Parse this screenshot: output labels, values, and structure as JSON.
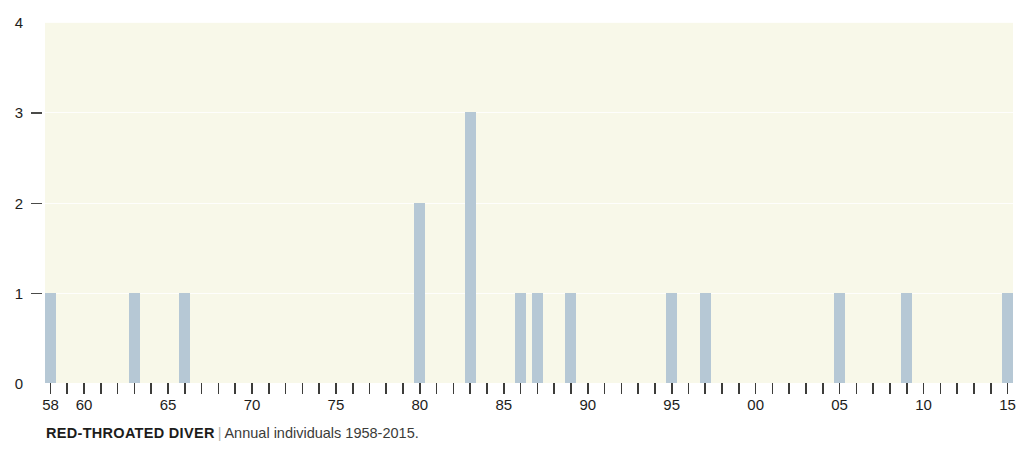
{
  "caption": {
    "species": "RED-THROATED DIVER",
    "separator": "|",
    "subtitle": "Annual individuals 1958-2015."
  },
  "chart_data": {
    "type": "bar",
    "title": "RED-THROATED DIVER",
    "subtitle": "Annual individuals 1958-2015.",
    "xlabel": "",
    "ylabel": "",
    "ylim": [
      0,
      4
    ],
    "xlim": [
      1958,
      2015
    ],
    "grid": true,
    "legend": null,
    "bar_color": "#b6c8d5",
    "plot_background": "#f8f8e9",
    "y_ticks": [
      0,
      1,
      2,
      3,
      4
    ],
    "y_tick_labels": [
      "0",
      "1",
      "2",
      "3",
      "4"
    ],
    "x_tick_years": [
      1958,
      1959,
      1960,
      1961,
      1962,
      1963,
      1964,
      1965,
      1966,
      1967,
      1968,
      1969,
      1970,
      1971,
      1972,
      1973,
      1974,
      1975,
      1976,
      1977,
      1978,
      1979,
      1980,
      1981,
      1982,
      1983,
      1984,
      1985,
      1986,
      1987,
      1988,
      1989,
      1990,
      1991,
      1992,
      1993,
      1994,
      1995,
      1996,
      1997,
      1998,
      1999,
      2000,
      2001,
      2002,
      2003,
      2004,
      2005,
      2006,
      2007,
      2008,
      2009,
      2010,
      2011,
      2012,
      2013,
      2014,
      2015
    ],
    "x_labeled_ticks": [
      {
        "year": 1958,
        "label": "58"
      },
      {
        "year": 1960,
        "label": "60"
      },
      {
        "year": 1965,
        "label": "65"
      },
      {
        "year": 1970,
        "label": "70"
      },
      {
        "year": 1975,
        "label": "75"
      },
      {
        "year": 1980,
        "label": "80"
      },
      {
        "year": 1985,
        "label": "85"
      },
      {
        "year": 1990,
        "label": "90"
      },
      {
        "year": 1995,
        "label": "95"
      },
      {
        "year": 2000,
        "label": "00"
      },
      {
        "year": 2005,
        "label": "05"
      },
      {
        "year": 2010,
        "label": "10"
      },
      {
        "year": 2015,
        "label": "15"
      }
    ],
    "categories": [
      1958,
      1959,
      1960,
      1961,
      1962,
      1963,
      1964,
      1965,
      1966,
      1967,
      1968,
      1969,
      1970,
      1971,
      1972,
      1973,
      1974,
      1975,
      1976,
      1977,
      1978,
      1979,
      1980,
      1981,
      1982,
      1983,
      1984,
      1985,
      1986,
      1987,
      1988,
      1989,
      1990,
      1991,
      1992,
      1993,
      1994,
      1995,
      1996,
      1997,
      1998,
      1999,
      2000,
      2001,
      2002,
      2003,
      2004,
      2005,
      2006,
      2007,
      2008,
      2009,
      2010,
      2011,
      2012,
      2013,
      2014,
      2015
    ],
    "values": [
      1,
      0,
      0,
      0,
      0,
      1,
      0,
      0,
      1,
      0,
      0,
      0,
      0,
      0,
      0,
      0,
      0,
      0,
      0,
      0,
      0,
      0,
      2,
      0,
      0,
      3,
      0,
      0,
      1,
      1,
      0,
      1,
      0,
      0,
      0,
      0,
      0,
      1,
      0,
      1,
      0,
      0,
      0,
      0,
      0,
      0,
      0,
      1,
      0,
      0,
      0,
      1,
      0,
      0,
      0,
      0,
      0,
      1
    ],
    "nonzero_points": [
      {
        "year": 1958,
        "value": 1
      },
      {
        "year": 1963,
        "value": 1
      },
      {
        "year": 1966,
        "value": 1
      },
      {
        "year": 1980,
        "value": 2
      },
      {
        "year": 1983,
        "value": 3
      },
      {
        "year": 1986,
        "value": 1
      },
      {
        "year": 1987,
        "value": 1
      },
      {
        "year": 1989,
        "value": 1
      },
      {
        "year": 1995,
        "value": 1
      },
      {
        "year": 1997,
        "value": 1
      },
      {
        "year": 2005,
        "value": 1
      },
      {
        "year": 2009,
        "value": 1
      },
      {
        "year": 2015,
        "value": 1
      }
    ]
  }
}
